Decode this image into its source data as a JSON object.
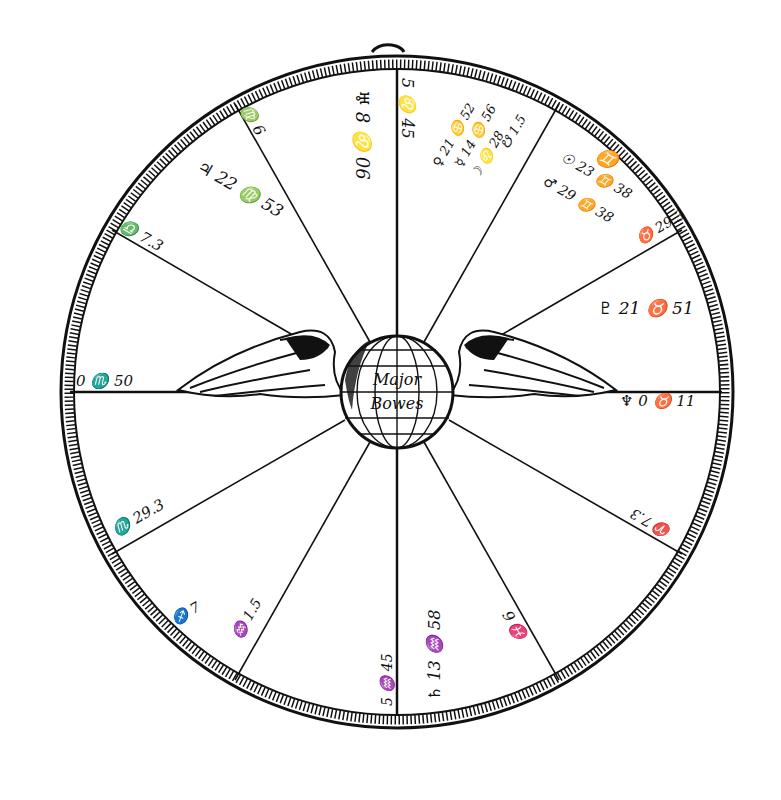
{
  "center": {
    "label_line1": "Major",
    "label_line2": "Bowes"
  },
  "colors": {
    "ink": "#111111",
    "paper": "#ffffff"
  },
  "houses": {
    "cusp_10": "5 ♌ 45",
    "cusp_11": "♍ 6",
    "cusp_12": "♎ 7.3",
    "asc": "0 ♏ 50",
    "cusp_2": "♏ 29.3",
    "cusp_3": "♐ 7",
    "cusp_4": "♒ 1.5",
    "cusp_4b": "5 ♒ 45",
    "cusp_5": "♓ 6",
    "cusp_6": "♈ 7.3",
    "desc": "0 ♉ 50",
    "cusp_8": "♉ 29.3",
    "cusp_9": "♊"
  },
  "planets": {
    "uranus": "♅ 8 ♌ 06",
    "jupiter": "♃ 22 ♍ 53",
    "venus": "♀ 21 ♋ 52",
    "mercury": "☿ 14 ♋ 56",
    "moon": "☽ ♌ 28",
    "dragon_tail": "☋ 1.5",
    "sun": "☉ 23 ♊ 38",
    "mars": "♂ 29 ♊ 38",
    "pluto": "♇ 21 ♉ 51",
    "neptune": "♆ 0 ♉ 11",
    "saturn": "♄ 13 ♒ 58",
    "node": "☊ 0 ♉ 50"
  }
}
